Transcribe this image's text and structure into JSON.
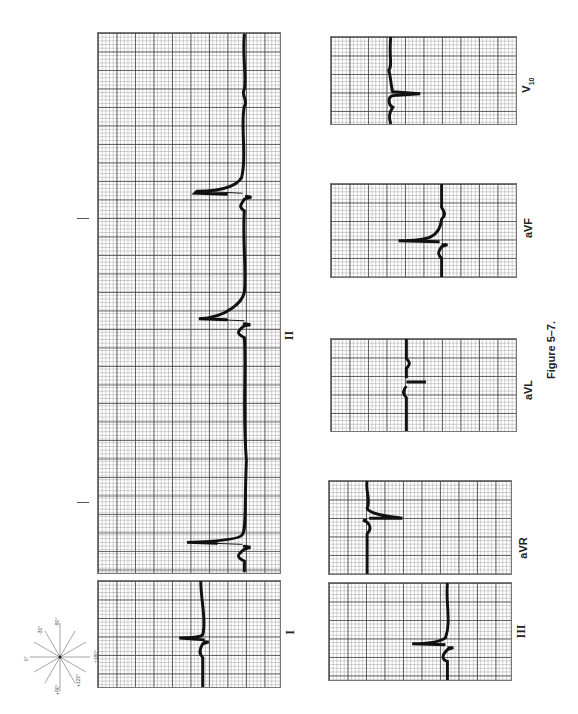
{
  "figure": {
    "caption": "Figure 5–7.",
    "orientation": "rotated 90° counter-clockwise"
  },
  "leads": {
    "II": {
      "label": "II"
    },
    "I": {
      "label": "I"
    },
    "III": {
      "label": "III"
    },
    "aVR": {
      "label": "aVR"
    },
    "aVL": {
      "label": "aVL"
    },
    "aVF": {
      "label": "aVF"
    },
    "V10": {
      "label": "V",
      "sub": "10"
    }
  },
  "hexaxial": {
    "title": "Hexaxial reference system",
    "angles": [
      "0°",
      "+30°",
      "+60°",
      "+90°",
      "+120°",
      "+150°",
      "±180°",
      "-150°",
      "-120°",
      "-90°",
      "-60°",
      "-30°"
    ],
    "lead_tags": [
      "I",
      "II",
      "III",
      "aVR",
      "aVL",
      "aVF"
    ]
  },
  "colors": {
    "grid_major": "#3c3c3c",
    "grid_minor": "#8a8a8a",
    "trace": "#111111",
    "background": "#ffffff"
  }
}
